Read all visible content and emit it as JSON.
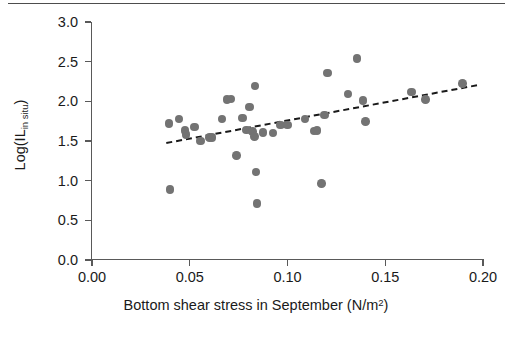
{
  "chart_data": {
    "type": "scatter",
    "title": "",
    "xlabel": "Bottom shear stress in September (N/m²)",
    "ylabel": "Log(IL in situ)",
    "ylabel_parts": {
      "base": "Log(IL",
      "subscript": "in situ",
      "tail": ")"
    },
    "xlabel_parts": {
      "base": "Bottom shear stress in September (N/m",
      "superscript": "2",
      "tail": ")"
    },
    "xlim": [
      0.0,
      0.2
    ],
    "ylim": [
      0.0,
      3.0
    ],
    "xticks": [
      "0.00",
      "0.05",
      "0.10",
      "0.15",
      "0.20"
    ],
    "xtick_values": [
      0.0,
      0.05,
      0.1,
      0.15,
      0.2
    ],
    "yticks": [
      "0.0",
      "0.5",
      "1.0",
      "1.5",
      "2.0",
      "2.5",
      "3.0"
    ],
    "ytick_values": [
      0.0,
      0.5,
      1.0,
      1.5,
      2.0,
      2.5,
      3.0
    ],
    "grid": false,
    "legend": null,
    "marker_color": "#737373",
    "trendline": {
      "style": "dashed",
      "color": "#1a1a1a",
      "x_start": 0.038,
      "y_start": 1.475,
      "x_end": 0.1975,
      "y_end": 2.205
    },
    "points": [
      {
        "x": 0.0395,
        "y": 1.72
      },
      {
        "x": 0.04,
        "y": 0.89
      },
      {
        "x": 0.0445,
        "y": 1.78
      },
      {
        "x": 0.0475,
        "y": 1.635
      },
      {
        "x": 0.048,
        "y": 1.585
      },
      {
        "x": 0.0525,
        "y": 1.675
      },
      {
        "x": 0.0555,
        "y": 1.5
      },
      {
        "x": 0.06,
        "y": 1.545
      },
      {
        "x": 0.0615,
        "y": 1.545
      },
      {
        "x": 0.0665,
        "y": 1.78
      },
      {
        "x": 0.069,
        "y": 2.02
      },
      {
        "x": 0.071,
        "y": 2.03
      },
      {
        "x": 0.074,
        "y": 1.315
      },
      {
        "x": 0.077,
        "y": 1.79
      },
      {
        "x": 0.079,
        "y": 1.64
      },
      {
        "x": 0.0805,
        "y": 1.93
      },
      {
        "x": 0.082,
        "y": 1.62
      },
      {
        "x": 0.083,
        "y": 1.555
      },
      {
        "x": 0.0835,
        "y": 2.195
      },
      {
        "x": 0.084,
        "y": 1.11
      },
      {
        "x": 0.0845,
        "y": 0.71
      },
      {
        "x": 0.0875,
        "y": 1.61
      },
      {
        "x": 0.0925,
        "y": 1.6
      },
      {
        "x": 0.0965,
        "y": 1.7
      },
      {
        "x": 0.1,
        "y": 1.7
      },
      {
        "x": 0.109,
        "y": 1.78
      },
      {
        "x": 0.1135,
        "y": 1.625
      },
      {
        "x": 0.115,
        "y": 1.635
      },
      {
        "x": 0.1175,
        "y": 0.965
      },
      {
        "x": 0.119,
        "y": 1.825
      },
      {
        "x": 0.1205,
        "y": 2.36
      },
      {
        "x": 0.131,
        "y": 2.095
      },
      {
        "x": 0.1355,
        "y": 2.54
      },
      {
        "x": 0.1385,
        "y": 2.01
      },
      {
        "x": 0.14,
        "y": 1.745
      },
      {
        "x": 0.1635,
        "y": 2.12
      },
      {
        "x": 0.1705,
        "y": 2.02
      },
      {
        "x": 0.1895,
        "y": 2.225
      }
    ]
  }
}
